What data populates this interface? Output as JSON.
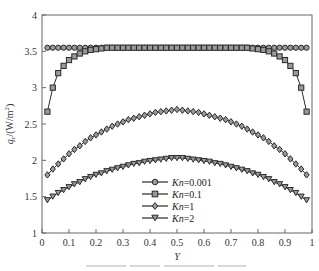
{
  "chart_data": {
    "type": "line",
    "title": "",
    "xlabel": "Y",
    "ylabel": "q_r/(W/m^2)",
    "ylabel_parts": {
      "var": "q",
      "sub": "r",
      "unit": "/(W/m",
      "sup": "2",
      "close": ")"
    },
    "xlim": [
      0,
      1
    ],
    "ylim": [
      1,
      4
    ],
    "grid": false,
    "legend_position": "lower center (inside plot)",
    "x_ticks": [
      0,
      0.1,
      0.2,
      0.3,
      0.4,
      0.5,
      0.6,
      0.7,
      0.8,
      0.9,
      1
    ],
    "x_tick_labels": [
      "0",
      "0.1",
      "0.2",
      "0.3",
      "0.4",
      "0.5",
      "0.6",
      "0.7",
      "0.8",
      "0.9",
      "1"
    ],
    "y_ticks": [
      1,
      1.5,
      2,
      2.5,
      3,
      3.5,
      4
    ],
    "y_tick_labels": [
      "1",
      "1.5",
      "2",
      "2.5",
      "3",
      "3.5",
      "4"
    ],
    "x": [
      0.02,
      0.04,
      0.06,
      0.08,
      0.1,
      0.12,
      0.14,
      0.16,
      0.18,
      0.2,
      0.22,
      0.24,
      0.26,
      0.28,
      0.3,
      0.32,
      0.34,
      0.36,
      0.38,
      0.4,
      0.42,
      0.44,
      0.46,
      0.48,
      0.5,
      0.52,
      0.54,
      0.56,
      0.58,
      0.6,
      0.62,
      0.64,
      0.66,
      0.68,
      0.7,
      0.72,
      0.74,
      0.76,
      0.78,
      0.8,
      0.82,
      0.84,
      0.86,
      0.88,
      0.9,
      0.92,
      0.94,
      0.96,
      0.98
    ],
    "series": [
      {
        "name": "Kn=0.001",
        "legend_kn": "Kn",
        "legend_value": "=0.001",
        "marker": "circle",
        "values": [
          3.55,
          3.55,
          3.55,
          3.55,
          3.55,
          3.55,
          3.55,
          3.55,
          3.55,
          3.55,
          3.55,
          3.55,
          3.55,
          3.55,
          3.55,
          3.55,
          3.55,
          3.55,
          3.55,
          3.55,
          3.55,
          3.55,
          3.55,
          3.55,
          3.55,
          3.55,
          3.55,
          3.55,
          3.55,
          3.55,
          3.55,
          3.55,
          3.55,
          3.55,
          3.55,
          3.55,
          3.55,
          3.55,
          3.55,
          3.55,
          3.55,
          3.55,
          3.55,
          3.55,
          3.55,
          3.55,
          3.55,
          3.55,
          3.55
        ]
      },
      {
        "name": "Kn=0.1",
        "legend_kn": "Kn",
        "legend_value": "=0.1",
        "marker": "square",
        "values": [
          2.67,
          3.0,
          3.2,
          3.3,
          3.38,
          3.43,
          3.47,
          3.5,
          3.52,
          3.53,
          3.54,
          3.55,
          3.55,
          3.55,
          3.55,
          3.55,
          3.55,
          3.55,
          3.55,
          3.55,
          3.55,
          3.55,
          3.55,
          3.55,
          3.55,
          3.55,
          3.55,
          3.55,
          3.55,
          3.55,
          3.55,
          3.55,
          3.55,
          3.55,
          3.55,
          3.55,
          3.55,
          3.55,
          3.54,
          3.53,
          3.52,
          3.5,
          3.47,
          3.43,
          3.38,
          3.3,
          3.2,
          3.0,
          2.67
        ]
      },
      {
        "name": "Kn=1",
        "legend_kn": "Kn",
        "legend_value": "=1",
        "marker": "diamond",
        "values": [
          1.8,
          1.88,
          1.95,
          2.02,
          2.09,
          2.15,
          2.2,
          2.26,
          2.31,
          2.35,
          2.39,
          2.43,
          2.47,
          2.5,
          2.53,
          2.56,
          2.58,
          2.6,
          2.62,
          2.64,
          2.66,
          2.67,
          2.68,
          2.69,
          2.7,
          2.69,
          2.68,
          2.67,
          2.66,
          2.64,
          2.62,
          2.6,
          2.58,
          2.56,
          2.53,
          2.5,
          2.47,
          2.43,
          2.39,
          2.35,
          2.31,
          2.26,
          2.2,
          2.15,
          2.09,
          2.02,
          1.95,
          1.88,
          1.8
        ]
      },
      {
        "name": "Kn=2",
        "legend_kn": "Kn",
        "legend_value": "=2",
        "marker": "triangle-down",
        "values": [
          1.45,
          1.5,
          1.55,
          1.59,
          1.63,
          1.67,
          1.7,
          1.74,
          1.77,
          1.8,
          1.82,
          1.85,
          1.87,
          1.89,
          1.91,
          1.93,
          1.95,
          1.96,
          1.98,
          1.99,
          2.0,
          2.01,
          2.02,
          2.03,
          2.03,
          2.03,
          2.02,
          2.01,
          2.0,
          1.99,
          1.98,
          1.96,
          1.95,
          1.93,
          1.91,
          1.89,
          1.87,
          1.85,
          1.82,
          1.8,
          1.77,
          1.74,
          1.7,
          1.67,
          1.63,
          1.59,
          1.55,
          1.5,
          1.45
        ]
      }
    ],
    "colors": {
      "line": "#2b2b2b",
      "marker_fill": "#9a9a9a",
      "axis": "#555555"
    }
  }
}
